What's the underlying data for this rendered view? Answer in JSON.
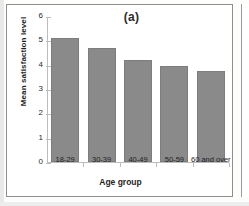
{
  "figure": {
    "panel_label": "(a)",
    "bar_color": "#8a8a8a",
    "axis_color": "#bdbdbd",
    "frame_color": "#8e8e8e"
  },
  "chart_data": {
    "type": "bar",
    "title": "(a)",
    "xlabel": "Age group",
    "ylabel": "Mean satisfaction level",
    "categories": [
      "18-29",
      "30-39",
      "40-49",
      "50-59",
      "60 and over"
    ],
    "values": [
      5.1,
      4.7,
      4.2,
      3.95,
      3.75
    ],
    "series": [
      {
        "name": "Mean satisfaction level",
        "values": [
          5.1,
          4.7,
          4.2,
          3.95,
          3.75
        ]
      }
    ],
    "ylim": [
      0,
      6
    ],
    "yticks": [
      0,
      1,
      2,
      3,
      4,
      5,
      6
    ],
    "ytick_labels": [
      "0",
      "1",
      "2",
      "3",
      "4",
      "5",
      "6"
    ],
    "grid": false,
    "legend": false,
    "legend_position": "none"
  }
}
